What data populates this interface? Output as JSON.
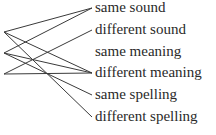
{
  "diagram": {
    "left_nodes": [
      {
        "id": "A",
        "x": 4,
        "y": 32
      },
      {
        "id": "B",
        "x": 4,
        "y": 53
      },
      {
        "id": "C",
        "x": 4,
        "y": 74
      }
    ],
    "right_labels": [
      {
        "text": "same sound",
        "y": 8
      },
      {
        "text": "different sound",
        "y": 30
      },
      {
        "text": "same meaning",
        "y": 52
      },
      {
        "text": "different meaning",
        "y": 73
      },
      {
        "text": "same spelling",
        "y": 95
      },
      {
        "text": "different spelling",
        "y": 117
      }
    ],
    "connections": [
      {
        "from": "A",
        "to": 0
      },
      {
        "from": "A",
        "to": 3
      },
      {
        "from": "A",
        "to": 5
      },
      {
        "from": "B",
        "to": 0
      },
      {
        "from": "B",
        "to": 3
      },
      {
        "from": "B",
        "to": 4
      },
      {
        "from": "C",
        "to": 1
      },
      {
        "from": "C",
        "to": 3
      }
    ],
    "line_color": "#3a3a3a",
    "text_color": "#2a2a2a"
  }
}
